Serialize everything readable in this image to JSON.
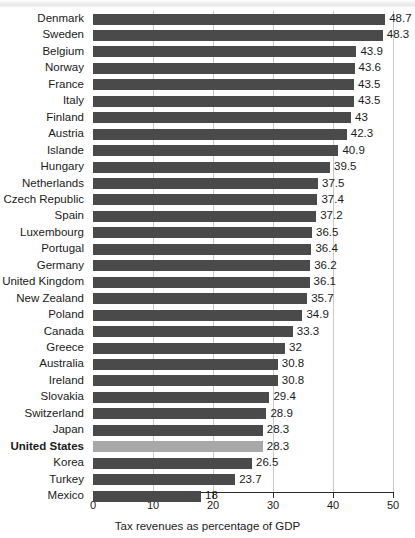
{
  "chart_data": {
    "type": "bar",
    "orientation": "horizontal",
    "title": "",
    "subtitle": "",
    "xlabel": "Tax revenues as percentage of GDP",
    "ylabel": "",
    "xlim": [
      0,
      50
    ],
    "xticks": [
      0,
      10,
      20,
      30,
      40,
      50
    ],
    "xtick_labels": [
      "0",
      "10",
      "20",
      "30",
      "40",
      "50"
    ],
    "grid": true,
    "grid_axis": "x",
    "legend": false,
    "bar_color": "#4a4a4a",
    "highlight_color": "#a8a8a8",
    "highlight_category": "United States",
    "categories": [
      "Denmark",
      "Sweden",
      "Belgium",
      "Norway",
      "France",
      "Italy",
      "Finland",
      "Austria",
      "Islande",
      "Hungary",
      "Netherlands",
      "Czech Republic",
      "Spain",
      "Luxembourg",
      "Portugal",
      "Germany",
      "United Kingdom",
      "New Zealand",
      "Poland",
      "Canada",
      "Greece",
      "Australia",
      "Ireland",
      "Slovakia",
      "Switzerland",
      "Japan",
      "United States",
      "Korea",
      "Turkey",
      "Mexico"
    ],
    "values": [
      48.7,
      48.3,
      43.9,
      43.6,
      43.5,
      43.5,
      43,
      42.3,
      40.9,
      39.5,
      37.5,
      37.4,
      37.2,
      36.5,
      36.4,
      36.2,
      36.1,
      35.7,
      34.9,
      33.3,
      32,
      30.8,
      30.8,
      29.4,
      28.9,
      28.3,
      28.3,
      26.5,
      23.7,
      18
    ],
    "value_labels": [
      "48.7",
      "48.3",
      "43.9",
      "43.6",
      "43.5",
      "43.5",
      "43",
      "42.3",
      "40.9",
      "39.5",
      "37.5",
      "37.4",
      "37.2",
      "36.5",
      "36.4",
      "36.2",
      "36.1",
      "35.7",
      "34.9",
      "33.3",
      "32",
      "30.8",
      "30.8",
      "29.4",
      "28.9",
      "28.3",
      "28.3",
      "26.5",
      "23.7",
      "18"
    ]
  }
}
